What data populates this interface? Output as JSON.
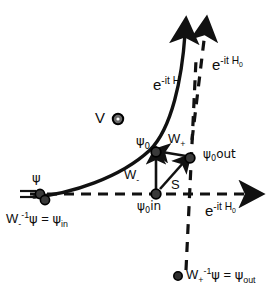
{
  "figure": {
    "colors": {
      "ink": "#111111",
      "background": "#ffffff",
      "node_fill": "#444444",
      "node_stroke": "#000000"
    }
  },
  "axes": {
    "horizontal_label": "e",
    "horizontal_exponent": "-it H",
    "horizontal_exponent_sub": "0",
    "vertical_label": "e",
    "vertical_exponent": "-it H",
    "vertical_exponent_sub": "0"
  },
  "curve": {
    "label": "e",
    "exponent": "-it H"
  },
  "points": {
    "v_label": "V",
    "psi_zero": "ψ",
    "psi_zero_sub": "0",
    "psi_zero_in": "ψ",
    "psi_zero_in_sub": "0",
    "psi_zero_in_suffix": "in",
    "psi_zero_out": "ψ",
    "psi_zero_out_sub": "0",
    "psi_zero_out_suffix": "out",
    "psi": "ψ"
  },
  "operators": {
    "w_minus": "W",
    "w_minus_sub": "-",
    "w_plus": "W",
    "w_plus_sub": "+",
    "s": "S"
  },
  "equations": {
    "in": {
      "op": "W",
      "op_sub": "-",
      "op_sup": "-1",
      "arg": "ψ",
      "eq": "=",
      "result": "ψ",
      "result_sub": "in"
    },
    "out": {
      "op": "W",
      "op_sub": "+",
      "op_sup": "-1",
      "arg": "ψ",
      "eq": "=",
      "result": "ψ",
      "result_sub": "out"
    }
  }
}
